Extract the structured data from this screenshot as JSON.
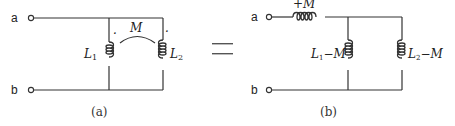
{
  "figure_a": {
    "caption": "(a)",
    "terminal_a": "a",
    "terminal_b": "b",
    "inductor_1_label": "L",
    "inductor_1_sub": "1",
    "inductor_2_label": "L",
    "inductor_2_sub": "2",
    "mutual_label": "M",
    "dot_marks": [
      "·",
      "·"
    ]
  },
  "equals_sign": "=",
  "figure_b": {
    "caption": "(b)",
    "terminal_a": "a",
    "terminal_b": "b",
    "series_inductor_label": "+M",
    "shunt_1_label_main": "L",
    "shunt_1_label_sub": "1",
    "shunt_1_label_rest": "−M",
    "shunt_2_label_main": "L",
    "shunt_2_label_sub": "2",
    "shunt_2_label_rest": "−M"
  }
}
